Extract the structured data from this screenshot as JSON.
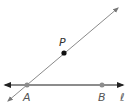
{
  "diagram": {
    "colors": {
      "line": "#8a8a8a",
      "horizontal_line": "#555555",
      "point_gray": "#8c8c8c",
      "point_black": "#111111",
      "label": "#333333"
    },
    "labels": {
      "P": "P",
      "A": "A",
      "B": "B",
      "l": "ℓ"
    },
    "lines": [
      {
        "name": "line-l",
        "from": [
          4,
          85
        ],
        "to": [
          124,
          85
        ],
        "arrows": "both"
      },
      {
        "name": "line-AP",
        "from": [
          7,
          102
        ],
        "to": [
          119,
          7
        ],
        "arrows": "both"
      }
    ],
    "points": [
      {
        "name": "A",
        "x": 27,
        "y": 85,
        "style": "gray"
      },
      {
        "name": "B",
        "x": 102,
        "y": 85,
        "style": "gray"
      },
      {
        "name": "P",
        "x": 64,
        "y": 53,
        "style": "black"
      }
    ]
  }
}
